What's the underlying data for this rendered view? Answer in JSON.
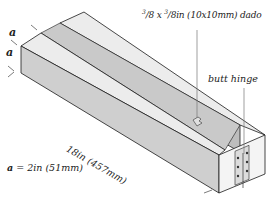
{
  "diagram": {
    "labels": {
      "dado_num1": "3",
      "dado_den1": "/8 x ",
      "dado_num2": "3",
      "dado_rest": "/8in (10x10mm) dado",
      "hinge": "butt hinge",
      "length": "18in (457mm)",
      "a_symbol": "a",
      "a_equation_rest": " = 2in (51mm)",
      "dim_a_top": "a",
      "dim_a_side": "a"
    },
    "colors": {
      "top_face": "#ececec",
      "side_face": "#cfcfcf",
      "end_face": "#f4f4f4",
      "groove": "#bdbdbd",
      "outline": "#1a1a1a",
      "leader": "#777777"
    }
  }
}
